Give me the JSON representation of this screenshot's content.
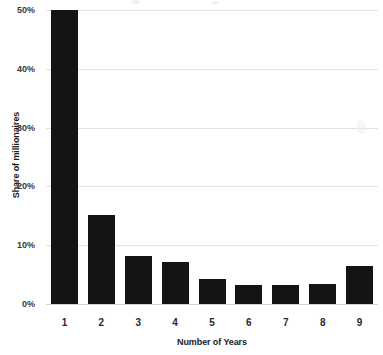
{
  "chart_data": {
    "type": "bar",
    "title": "",
    "xlabel": "Number of Years",
    "ylabel": "Share of millionaires",
    "categories": [
      "1",
      "2",
      "3",
      "4",
      "5",
      "6",
      "7",
      "8",
      "9"
    ],
    "values": [
      50,
      15.2,
      8.2,
      7.2,
      4.2,
      3.3,
      3.3,
      3.4,
      6.5
    ],
    "ylim": [
      0,
      50
    ],
    "ytick_labels": [
      "0%",
      "10%",
      "20%",
      "30%",
      "40%",
      "50%"
    ],
    "ytick_values": [
      0,
      10,
      20,
      30,
      40,
      50
    ],
    "grid": true,
    "legend": "none",
    "bar_color": "#141414",
    "gridline_color": "#e3e3e3",
    "axis_color": "#d2d2d2",
    "note_top_bar_clipped": "1"
  }
}
